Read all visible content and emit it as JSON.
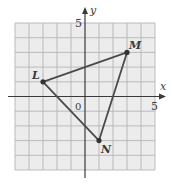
{
  "diagram": {
    "type": "coordinate-plane-triangle",
    "grid": {
      "xmin": -5,
      "xmax": 5,
      "ymin": -5,
      "ymax": 5,
      "step": 1
    },
    "axes": {
      "x_label": "x",
      "y_label": "y",
      "x_tick_label": "5",
      "y_tick_label": "5",
      "origin_label": "0"
    },
    "points": [
      {
        "name": "L",
        "x": -3,
        "y": 1
      },
      {
        "name": "M",
        "x": 3,
        "y": 3
      },
      {
        "name": "N",
        "x": 1,
        "y": -3
      }
    ],
    "colors": {
      "grid_fill": "#ececec",
      "grid_line": "#b5b5b5",
      "axis": "#3a3a3a",
      "triangle": "#4a4a4a"
    }
  }
}
